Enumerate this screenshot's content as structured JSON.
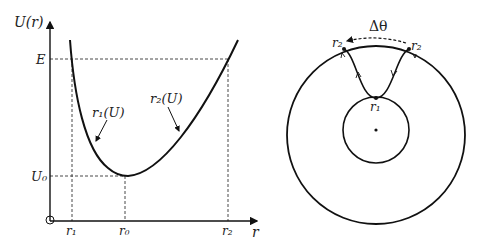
{
  "left_plot": {
    "y_axis_label": "U(r)",
    "x_axis_label": "r",
    "y_ticks": {
      "E": "E",
      "U0": "U₀"
    },
    "x_ticks": {
      "r1": "r₁",
      "r0": "r₀",
      "r2": "r₂"
    },
    "curve_labels": {
      "left_branch": "r₁(U)",
      "right_branch": "r₂(U)"
    },
    "origin_marker": "O"
  },
  "right_plot": {
    "angle_label": "Δθ",
    "outer_point_label_left": "r₂",
    "outer_point_label_right": "r₂",
    "inner_point_label": "r₁"
  }
}
